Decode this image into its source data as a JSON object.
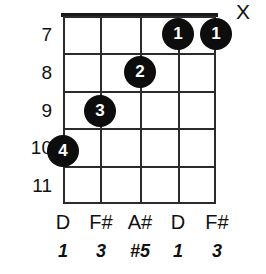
{
  "diagram": {
    "type": "guitar-chord-diagram",
    "frets": [
      {
        "number": "7"
      },
      {
        "number": "8"
      },
      {
        "number": "9"
      },
      {
        "number": "10"
      },
      {
        "number": "11"
      }
    ],
    "strings": [
      {
        "note": "D",
        "interval": "1"
      },
      {
        "note": "F#",
        "interval": "3"
      },
      {
        "note": "A#",
        "interval": "#5"
      },
      {
        "note": "D",
        "interval": "1"
      },
      {
        "note": "F#",
        "interval": "3"
      }
    ],
    "dots": [
      {
        "finger": "1",
        "string_index": 3,
        "fret": "7"
      },
      {
        "finger": "1",
        "string_index": 4,
        "fret": "7"
      },
      {
        "finger": "2",
        "string_index": 2,
        "fret": "8"
      },
      {
        "finger": "3",
        "string_index": 1,
        "fret": "9"
      },
      {
        "finger": "4",
        "string_index": 0,
        "fret": "10"
      }
    ],
    "mute_marker": "X",
    "colors": {
      "ink": "#111111",
      "grid": "#2b2b2b",
      "dot_fill": "#0d0d0d",
      "dot_text": "#ffffff",
      "background": "#ffffff"
    }
  }
}
